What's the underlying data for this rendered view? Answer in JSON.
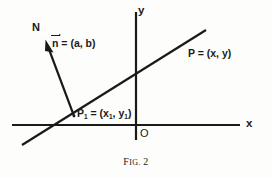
{
  "figure": {
    "caption_prefix": "F",
    "caption_smallcaps": "IG.",
    "caption_number": "2",
    "caption_full": "Fig. 2"
  },
  "axes": {
    "y_label": "y",
    "x_label": "x",
    "origin_label": "O",
    "x_axis_y_px": 125,
    "y_axis_x_px": 136,
    "x_axis_start_px": 12,
    "x_axis_end_px": 240,
    "y_axis_top_px": 12,
    "y_axis_bottom_px": 140
  },
  "labels": {
    "normal_direction": "N",
    "normal_vector_name": "n",
    "normal_vector_equals": " = (a, b)",
    "point_P": "P = (x, y)",
    "point_P1_name": "P",
    "point_P1_sub": "1",
    "point_P1_rest": " = (x",
    "point_P1_sub2": "1",
    "point_P1_mid": ", y",
    "point_P1_sub3": "1",
    "point_P1_end": ")"
  },
  "geometry": {
    "line_start": [
      22,
      145
    ],
    "line_end": [
      206,
      30
    ],
    "normal_tail": [
      74,
      116
    ],
    "normal_tip": [
      46,
      42
    ],
    "point_P1": [
      74,
      116
    ],
    "point_P": [
      186,
      43
    ]
  },
  "colors": {
    "ink": "#1a1a1a",
    "background": "#fdfdfc"
  }
}
